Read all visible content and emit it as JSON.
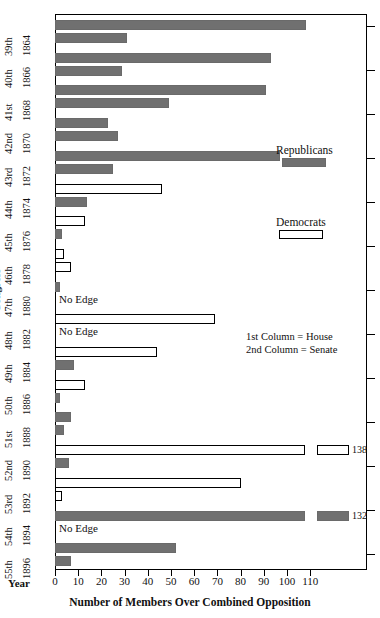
{
  "chart_data": {
    "type": "bar",
    "title": "",
    "xlabel": "Number of Members Over Combined Opposition",
    "ylabel": "Congress",
    "ylabel2": "Year",
    "xlim": [
      0,
      120
    ],
    "xticks": [
      0,
      10,
      20,
      30,
      40,
      50,
      60,
      70,
      80,
      90,
      100,
      110
    ],
    "grid": false,
    "orientation": "horizontal",
    "broken_axis": true,
    "legend": {
      "position": "upper-right-inside",
      "entries": [
        {
          "name": "Republicans",
          "color": "#707070",
          "style": "filled"
        },
        {
          "name": "Democrats",
          "color": "#ffffff",
          "style": "outlined"
        }
      ]
    },
    "annotation": [
      "1st Column = House",
      "2nd Column = Senate"
    ],
    "categories": [
      {
        "congress": "39th",
        "year": "1864"
      },
      {
        "congress": "40th",
        "year": "1866"
      },
      {
        "congress": "41st",
        "year": "1868"
      },
      {
        "congress": "42nd",
        "year": "1870"
      },
      {
        "congress": "43rd",
        "year": "1872"
      },
      {
        "congress": "44th",
        "year": "1874"
      },
      {
        "congress": "45th",
        "year": "1876"
      },
      {
        "congress": "46th",
        "year": "1878"
      },
      {
        "congress": "47th",
        "year": "1880"
      },
      {
        "congress": "48th",
        "year": "1882"
      },
      {
        "congress": "49th",
        "year": "1884"
      },
      {
        "congress": "50th",
        "year": "1886"
      },
      {
        "congress": "51st",
        "year": "1888"
      },
      {
        "congress": "52nd",
        "year": "1890"
      },
      {
        "congress": "53rd",
        "year": "1892"
      },
      {
        "congress": "54th",
        "year": "1894"
      },
      {
        "congress": "55th",
        "year": "1896"
      }
    ],
    "bars": [
      {
        "congress": "39th",
        "chamber": "House",
        "party": "Republicans",
        "value": 108
      },
      {
        "congress": "39th",
        "chamber": "Senate",
        "party": "Republicans",
        "value": 31
      },
      {
        "congress": "40th",
        "chamber": "House",
        "party": "Republicans",
        "value": 93
      },
      {
        "congress": "40th",
        "chamber": "Senate",
        "party": "Republicans",
        "value": 29
      },
      {
        "congress": "41st",
        "chamber": "House",
        "party": "Republicans",
        "value": 91
      },
      {
        "congress": "41st",
        "chamber": "Senate",
        "party": "Republicans",
        "value": 49
      },
      {
        "congress": "42nd",
        "chamber": "House",
        "party": "Republicans",
        "value": 23
      },
      {
        "congress": "42nd",
        "chamber": "Senate",
        "party": "Republicans",
        "value": 27
      },
      {
        "congress": "43rd",
        "chamber": "House",
        "party": "Republicans",
        "value": 97
      },
      {
        "congress": "43rd",
        "chamber": "Senate",
        "party": "Republicans",
        "value": 25
      },
      {
        "congress": "44th",
        "chamber": "House",
        "party": "Democrats",
        "value": 46
      },
      {
        "congress": "44th",
        "chamber": "Senate",
        "party": "Republicans",
        "value": 14
      },
      {
        "congress": "45th",
        "chamber": "House",
        "party": "Democrats",
        "value": 13
      },
      {
        "congress": "45th",
        "chamber": "Senate",
        "party": "Republicans",
        "value": 3
      },
      {
        "congress": "46th",
        "chamber": "House",
        "party": "Democrats",
        "value": 4
      },
      {
        "congress": "46th",
        "chamber": "Senate",
        "party": "Democrats",
        "value": 7
      },
      {
        "congress": "47th",
        "chamber": "House",
        "party": "Republicans",
        "value": 2
      },
      {
        "congress": "47th",
        "chamber": "Senate",
        "party": null,
        "value": null,
        "label": "No Edge"
      },
      {
        "congress": "48th",
        "chamber": "House",
        "party": "Democrats",
        "value": 69
      },
      {
        "congress": "48th",
        "chamber": "Senate",
        "party": null,
        "value": null,
        "label": "No Edge"
      },
      {
        "congress": "49th",
        "chamber": "House",
        "party": "Democrats",
        "value": 44
      },
      {
        "congress": "49th",
        "chamber": "Senate",
        "party": "Republicans",
        "value": 8
      },
      {
        "congress": "50th",
        "chamber": "House",
        "party": "Democrats",
        "value": 13
      },
      {
        "congress": "50th",
        "chamber": "Senate",
        "party": "Republicans",
        "value": 2
      },
      {
        "congress": "51st",
        "chamber": "House",
        "party": "Republicans",
        "value": 7
      },
      {
        "congress": "51st",
        "chamber": "Senate",
        "party": "Republicans",
        "value": 4
      },
      {
        "congress": "52nd",
        "chamber": "House",
        "party": "Democrats",
        "value": 138,
        "data_label": "138",
        "broken": true
      },
      {
        "congress": "52nd",
        "chamber": "Senate",
        "party": "Republicans",
        "value": 6
      },
      {
        "congress": "53rd",
        "chamber": "House",
        "party": "Democrats",
        "value": 80
      },
      {
        "congress": "53rd",
        "chamber": "Senate",
        "party": "Democrats",
        "value": 3
      },
      {
        "congress": "54th",
        "chamber": "House",
        "party": "Republicans",
        "value": 132,
        "data_label": "132",
        "broken": true
      },
      {
        "congress": "54th",
        "chamber": "Senate",
        "party": null,
        "value": null,
        "label": "No Edge"
      },
      {
        "congress": "55th",
        "chamber": "House",
        "party": "Republicans",
        "value": 52
      },
      {
        "congress": "55th",
        "chamber": "Senate",
        "party": "Republicans",
        "value": 7
      }
    ]
  },
  "axes": {
    "x_title": "Number of Members Over Combined Opposition",
    "y_title": "Congress",
    "year_title": "Year",
    "tick_labels": [
      "0",
      "10",
      "20",
      "30",
      "40",
      "50",
      "60",
      "70",
      "80",
      "90",
      "100",
      "110"
    ]
  },
  "legend": {
    "republicans_label": "Republicans",
    "democrats_label": "Democrats"
  },
  "notes": {
    "line1": "1st Column = House",
    "line2": "2nd Column = Senate"
  },
  "colors": {
    "republican": "#707070",
    "democrat": "#ffffff",
    "outline": "#000000"
  }
}
